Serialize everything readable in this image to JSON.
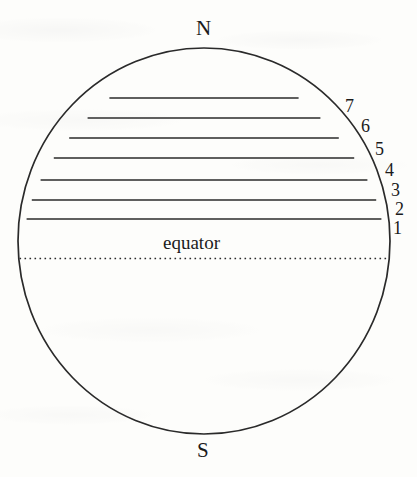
{
  "figure": {
    "name": "earth-latitude-zones-diagram",
    "background_color": "#fdfdfb",
    "ink_color": "#1b1b1b",
    "globe": {
      "center_x": 204,
      "center_y": 241,
      "radius_x": 186,
      "radius_y": 193,
      "stroke_width": 1.6
    },
    "poles": {
      "north_label": "N",
      "south_label": "S"
    },
    "equator": {
      "label": "equator",
      "y": 258,
      "style": "dotted"
    },
    "zone_lines": [
      {
        "number": "1",
        "y": 219
      },
      {
        "number": "2",
        "y": 200
      },
      {
        "number": "3",
        "y": 180
      },
      {
        "number": "4",
        "y": 158
      },
      {
        "number": "5",
        "y": 138
      },
      {
        "number": "6",
        "y": 118
      },
      {
        "number": "7",
        "y": 98
      }
    ],
    "zone_number_labels": [
      {
        "text": "7",
        "x": 345,
        "y": 97
      },
      {
        "text": "6",
        "x": 361,
        "y": 117
      },
      {
        "text": "5",
        "x": 375,
        "y": 140
      },
      {
        "text": "4",
        "x": 385,
        "y": 161
      },
      {
        "text": "3",
        "x": 391,
        "y": 181
      },
      {
        "text": "2",
        "x": 395,
        "y": 200
      },
      {
        "text": "1",
        "x": 393,
        "y": 219
      }
    ]
  }
}
